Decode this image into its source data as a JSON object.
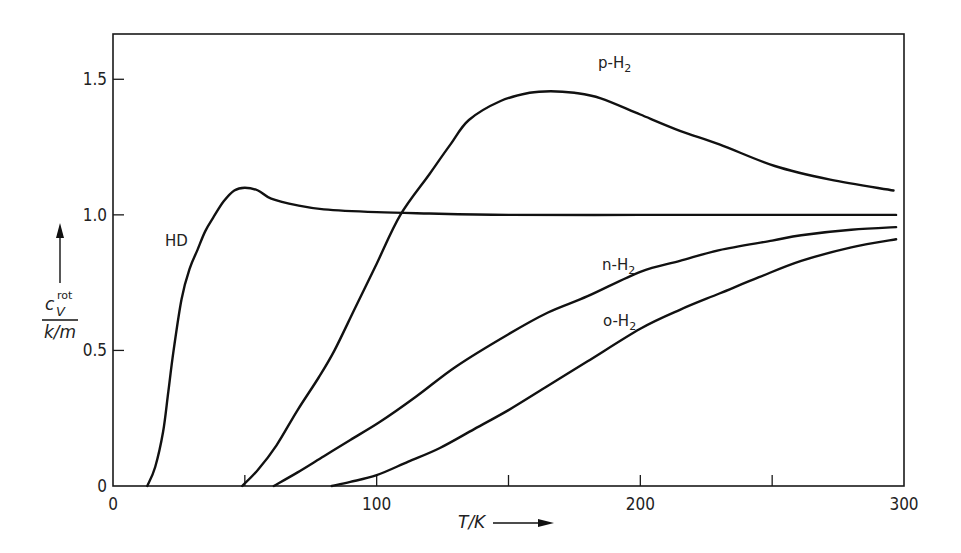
{
  "chart_data": {
    "type": "line",
    "title": "",
    "xlabel": "T/K",
    "ylabel": "c_V^rot / (k/m)",
    "ylabel_parts": {
      "symbol": "c",
      "subscript": "V",
      "superscript": "rot",
      "denominator": "k/m"
    },
    "xlim": [
      0,
      300
    ],
    "ylim": [
      0,
      1.667
    ],
    "grid": false,
    "legend": "inline labels",
    "x_ticks": [
      {
        "value": 0,
        "label": "0"
      },
      {
        "value": 50,
        "label": ""
      },
      {
        "value": 100,
        "label": "100"
      },
      {
        "value": 150,
        "label": ""
      },
      {
        "value": 200,
        "label": "200"
      },
      {
        "value": 250,
        "label": ""
      },
      {
        "value": 300,
        "label": "300"
      }
    ],
    "y_ticks": [
      {
        "value": 0,
        "label": "0"
      },
      {
        "value": 0.5,
        "label": "0.5"
      },
      {
        "value": 1.0,
        "label": "1.0"
      },
      {
        "value": 1.5,
        "label": "1.5"
      }
    ],
    "series": [
      {
        "name": "HD",
        "label": "HD",
        "points": [
          [
            13,
            0
          ],
          [
            16,
            0.07
          ],
          [
            19,
            0.2
          ],
          [
            21,
            0.35
          ],
          [
            23,
            0.5
          ],
          [
            26,
            0.69
          ],
          [
            29,
            0.8
          ],
          [
            32,
            0.87
          ],
          [
            35,
            0.94
          ],
          [
            38,
            0.99
          ],
          [
            42,
            1.05
          ],
          [
            46,
            1.09
          ],
          [
            50,
            1.1
          ],
          [
            55,
            1.09
          ],
          [
            60,
            1.06
          ],
          [
            70,
            1.035
          ],
          [
            80,
            1.02
          ],
          [
            100,
            1.01
          ],
          [
            120,
            1.005
          ],
          [
            150,
            1.0
          ],
          [
            200,
            1.0
          ],
          [
            250,
            1.0
          ],
          [
            297,
            1.0
          ]
        ]
      },
      {
        "name": "p-H2",
        "label": "p-H",
        "label_sub": "2",
        "points": [
          [
            49,
            0
          ],
          [
            55,
            0.06
          ],
          [
            62,
            0.15
          ],
          [
            70,
            0.28
          ],
          [
            78,
            0.4
          ],
          [
            84,
            0.5
          ],
          [
            92,
            0.66
          ],
          [
            100,
            0.82
          ],
          [
            109,
            1.0
          ],
          [
            120,
            1.15
          ],
          [
            128,
            1.26
          ],
          [
            135,
            1.35
          ],
          [
            147,
            1.42
          ],
          [
            158,
            1.45
          ],
          [
            166,
            1.456
          ],
          [
            175,
            1.45
          ],
          [
            185,
            1.43
          ],
          [
            200,
            1.37
          ],
          [
            215,
            1.31
          ],
          [
            230,
            1.26
          ],
          [
            251,
            1.18
          ],
          [
            272,
            1.13
          ],
          [
            296,
            1.09
          ]
        ]
      },
      {
        "name": "n-H2",
        "label": "n-H",
        "label_sub": "2",
        "points": [
          [
            61,
            0
          ],
          [
            70,
            0.05
          ],
          [
            80,
            0.11
          ],
          [
            90,
            0.17
          ],
          [
            101,
            0.235
          ],
          [
            115,
            0.33
          ],
          [
            130,
            0.44
          ],
          [
            150,
            0.56
          ],
          [
            165,
            0.64
          ],
          [
            180,
            0.7
          ],
          [
            200,
            0.79
          ],
          [
            215,
            0.83
          ],
          [
            230,
            0.87
          ],
          [
            250,
            0.905
          ],
          [
            261,
            0.925
          ],
          [
            280,
            0.945
          ],
          [
            297,
            0.955
          ]
        ]
      },
      {
        "name": "o-H2",
        "label": "o-H",
        "label_sub": "2",
        "points": [
          [
            83,
            0
          ],
          [
            90,
            0.015
          ],
          [
            100,
            0.04
          ],
          [
            112,
            0.09
          ],
          [
            124,
            0.14
          ],
          [
            137,
            0.21
          ],
          [
            150,
            0.28
          ],
          [
            165,
            0.37
          ],
          [
            180,
            0.46
          ],
          [
            200,
            0.58
          ],
          [
            215,
            0.65
          ],
          [
            230,
            0.71
          ],
          [
            245,
            0.77
          ],
          [
            261,
            0.83
          ],
          [
            280,
            0.88
          ],
          [
            297,
            0.91
          ]
        ]
      }
    ]
  }
}
